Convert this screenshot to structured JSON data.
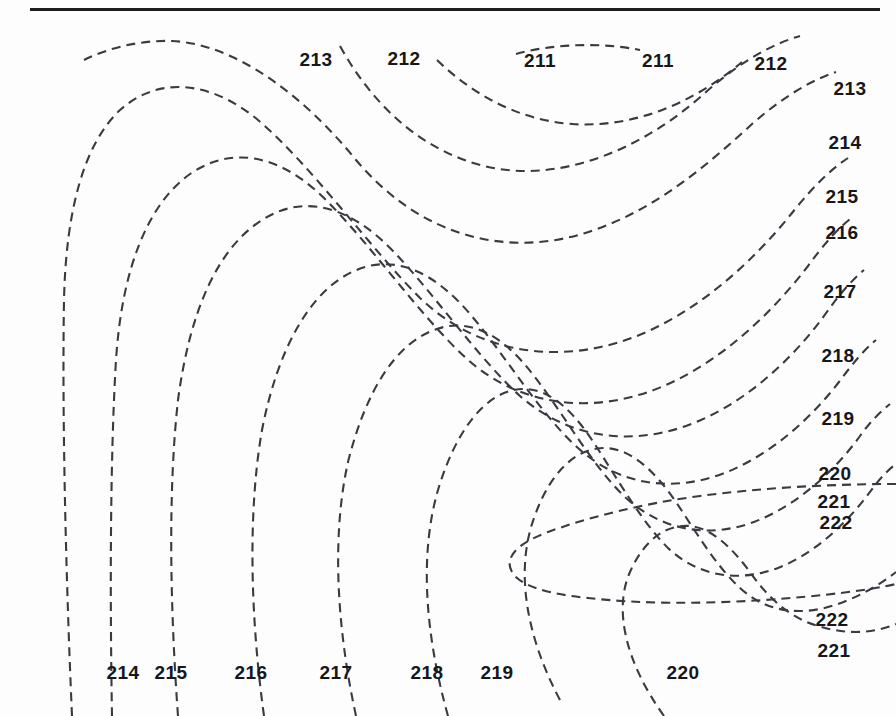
{
  "figure": {
    "width": 896,
    "height": 716,
    "background_color": "#fdfdfd",
    "rule_color": "#1d1d1d",
    "contour_color": "#3a3a42",
    "label_color": "#17171b"
  },
  "header_rule": {
    "x": 30,
    "y": 8,
    "width": 850,
    "height": 3
  },
  "chart_data": {
    "type": "line",
    "title": "",
    "subtitle": "",
    "xlabel": "",
    "ylabel": "",
    "grid": false,
    "legend": null,
    "contour_interval": 1,
    "value_min": 211,
    "value_max": 222,
    "line_style": "dashed",
    "labels": [
      {
        "text": "213",
        "x": 316,
        "y": 59
      },
      {
        "text": "212",
        "x": 404,
        "y": 58
      },
      {
        "text": "211",
        "x": 540,
        "y": 60
      },
      {
        "text": "211",
        "x": 658,
        "y": 60
      },
      {
        "text": "212",
        "x": 771,
        "y": 63
      },
      {
        "text": "213",
        "x": 850,
        "y": 88
      },
      {
        "text": "214",
        "x": 845,
        "y": 142
      },
      {
        "text": "215",
        "x": 842,
        "y": 196
      },
      {
        "text": "216",
        "x": 842,
        "y": 232
      },
      {
        "text": "217",
        "x": 840,
        "y": 291
      },
      {
        "text": "218",
        "x": 838,
        "y": 355
      },
      {
        "text": "219",
        "x": 838,
        "y": 418
      },
      {
        "text": "220",
        "x": 835,
        "y": 473
      },
      {
        "text": "221",
        "x": 834,
        "y": 501
      },
      {
        "text": "222",
        "x": 836,
        "y": 522
      },
      {
        "text": "222",
        "x": 832,
        "y": 619
      },
      {
        "text": "221",
        "x": 834,
        "y": 650
      },
      {
        "text": "214",
        "x": 123,
        "y": 672
      },
      {
        "text": "215",
        "x": 171,
        "y": 672
      },
      {
        "text": "216",
        "x": 251,
        "y": 672
      },
      {
        "text": "217",
        "x": 336,
        "y": 672
      },
      {
        "text": "218",
        "x": 427,
        "y": 672
      },
      {
        "text": "219",
        "x": 497,
        "y": 672
      },
      {
        "text": "220",
        "x": 683,
        "y": 672
      }
    ],
    "contours": [
      {
        "value": 211,
        "name": "contour-211-arc",
        "path": "M 516 54 C 552 44 600 42 640 50"
      },
      {
        "value": 211,
        "name": "contour-211-main",
        "path": "M 437 60 C 470 92 516 120 572 124 C 630 128 690 106 742 62"
      },
      {
        "value": 212,
        "name": "contour-212",
        "path": "M 340 46 C 372 104 420 150 484 166 C 556 184 640 152 706 92 C 740 62 772 44 800 36"
      },
      {
        "value": 213,
        "name": "contour-213",
        "path": "M 84 60 C 108 48 140 40 172 41 C 236 44 304 96 356 160 C 410 224 480 252 556 240 C 636 226 700 172 752 124 C 784 96 812 80 836 72"
      },
      {
        "value": 214,
        "name": "contour-214",
        "path": "M 72 716 C 66 580 62 420 64 300 C 66 210 84 144 120 110 C 158 76 210 80 258 120 C 312 166 370 248 420 298 C 474 350 548 364 620 342 C 690 320 752 264 796 208 C 814 186 830 170 848 158"
      },
      {
        "value": 215,
        "name": "contour-215",
        "path": "M 112 716 C 110 600 110 460 116 360 C 122 268 148 204 190 174 C 234 144 282 156 326 200 C 372 246 420 316 466 358 C 516 404 584 414 648 392 C 712 370 768 318 808 266 C 824 244 838 228 854 216"
      },
      {
        "value": 216,
        "name": "contour-216",
        "path": "M 178 716 C 170 606 168 490 178 400 C 190 310 218 248 262 220 C 306 192 352 208 394 252 C 436 296 478 358 520 396 C 568 438 628 446 686 426 C 742 406 790 362 824 316 C 838 296 850 282 864 270"
      },
      {
        "value": 217,
        "name": "contour-217",
        "path": "M 264 716 C 250 614 248 510 262 430 C 278 348 310 292 352 272 C 394 252 434 272 470 314 C 506 356 540 414 578 448 C 620 486 672 492 722 474 C 770 456 812 418 842 378 C 854 362 864 350 876 340"
      },
      {
        "value": 218,
        "name": "contour-218",
        "path": "M 356 716 C 336 624 332 534 348 462 C 366 390 396 344 434 330 C 470 316 504 336 534 376 C 564 414 592 466 626 498 C 664 532 710 538 754 522 C 796 506 834 472 860 436 C 870 422 880 412 890 404"
      },
      {
        "value": 219,
        "name": "contour-219",
        "path": "M 448 716 C 424 630 420 552 438 490 C 456 430 484 396 514 390 C 542 384 568 404 592 440 C 616 476 640 520 668 548 C 700 578 740 582 778 568 C 814 554 846 524 870 492 C 880 478 888 470 896 464"
      },
      {
        "value": 220,
        "name": "contour-220",
        "path": "M 560 700 C 524 632 516 568 534 518 C 550 472 576 448 604 448 C 630 448 654 470 676 502 C 696 532 716 566 740 588 C 768 614 804 616 838 604 C 866 594 886 580 896 572"
      },
      {
        "value": 221,
        "name": "contour-221",
        "path": "M 664 716 C 624 660 614 608 630 572 C 644 540 666 524 690 526 C 712 528 732 548 750 572 C 768 598 790 618 818 626 C 850 636 878 632 896 624"
      },
      {
        "value": 222,
        "name": "contour-222-nose",
        "path": "M 896 484 C 830 484 760 488 700 496 C 640 504 586 518 548 532 C 516 544 504 558 512 572 C 520 586 548 594 588 598 C 640 604 704 604 764 600 C 824 596 870 590 896 584"
      }
    ]
  }
}
